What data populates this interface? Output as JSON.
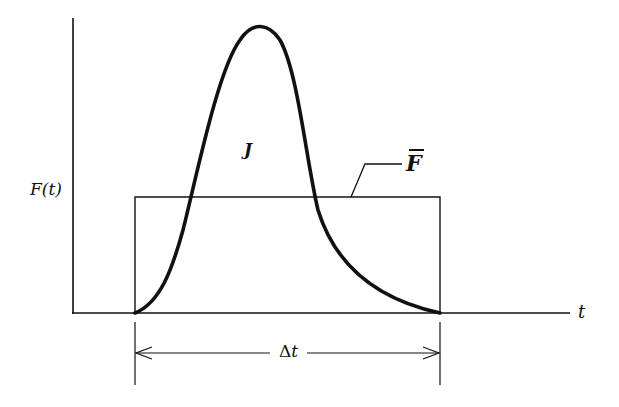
{
  "diagram": {
    "type": "impulse-force-time-graph",
    "y_axis_label": "F(t)",
    "x_axis_label": "t",
    "area_label": "J",
    "average_force_label": "F",
    "average_force_label_has_overbar": true,
    "interval_label": "Δt",
    "interval_label_delta": "Δ",
    "interval_label_var": "t",
    "colors": {
      "stroke": "#111111",
      "background": "#ffffff"
    },
    "elements": {
      "curve": "bell-shaped force pulse F(t) rising from 0 at start of interval, peaking, and returning to 0 at end of interval",
      "rectangle": "average force F-bar constant over interval Δt, same area as curve",
      "dimension": "double-headed arrow spanning interval Δt"
    }
  }
}
